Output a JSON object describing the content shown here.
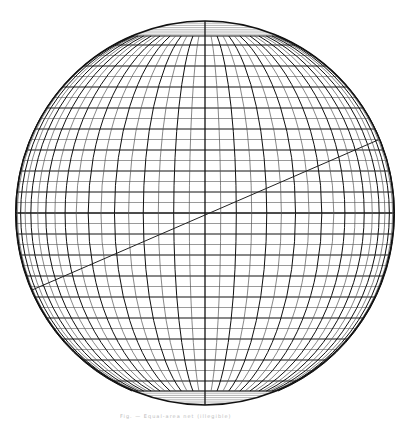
{
  "figure": {
    "type": "spherical-projection-net",
    "circle": {
      "cx": 205,
      "cy": 213,
      "rx": 189,
      "ry": 192
    },
    "meridian_count_each_side": 18,
    "parallel_spacing_px": 10.5,
    "polar_cap_top_y": 36,
    "polar_cap_bottom_y": 391,
    "diagonal_line": {
      "x1": 32,
      "y1": 290,
      "x2": 378,
      "y2": 140
    },
    "line_color": "#111111",
    "minor_line_color": "#555555"
  },
  "caption": {
    "text": "Fig. — Equal-area net (illegible)"
  }
}
